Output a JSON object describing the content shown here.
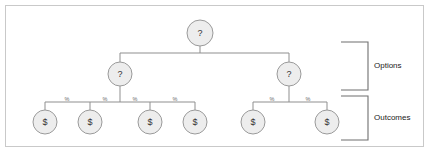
{
  "figure": {
    "background_color": "#ffffff",
    "border_color": "#c9c9c9",
    "node_fill": "#ededed",
    "node_stroke": "#9a9a9a",
    "edge_color": "#8f8f8f"
  },
  "nodes": {
    "root": {
      "label": "?",
      "cx": 200,
      "cy": 33,
      "r": 13
    },
    "decisions": [
      {
        "label": "?",
        "cx": 120,
        "cy": 74,
        "r": 12
      },
      {
        "label": "?",
        "cx": 289,
        "cy": 74,
        "r": 12
      }
    ],
    "outcomes": [
      {
        "label": "$",
        "cx": 45,
        "cy": 122,
        "r": 12
      },
      {
        "label": "$",
        "cx": 90,
        "cy": 122,
        "r": 12
      },
      {
        "label": "$",
        "cx": 150,
        "cy": 122,
        "r": 12
      },
      {
        "label": "$",
        "cx": 195,
        "cy": 122,
        "r": 12
      },
      {
        "label": "$",
        "cx": 253,
        "cy": 122,
        "r": 12
      },
      {
        "label": "$",
        "cx": 327,
        "cy": 122,
        "r": 12
      }
    ]
  },
  "probability_labels": [
    {
      "text": "%",
      "x": 67,
      "y": 101
    },
    {
      "text": "%",
      "x": 105,
      "y": 101
    },
    {
      "text": "%",
      "x": 135,
      "y": 101
    },
    {
      "text": "%",
      "x": 175,
      "y": 101
    },
    {
      "text": "%",
      "x": 272,
      "y": 101
    },
    {
      "text": "%",
      "x": 308,
      "y": 101
    }
  ],
  "brackets": [
    {
      "name": "options",
      "label": "Options",
      "top": 42,
      "bottom": 90,
      "label_x": 374,
      "label_y": 66
    },
    {
      "name": "outcomes",
      "label": "Outcomes",
      "top": 96,
      "bottom": 140,
      "label_x": 374,
      "label_y": 118
    }
  ]
}
